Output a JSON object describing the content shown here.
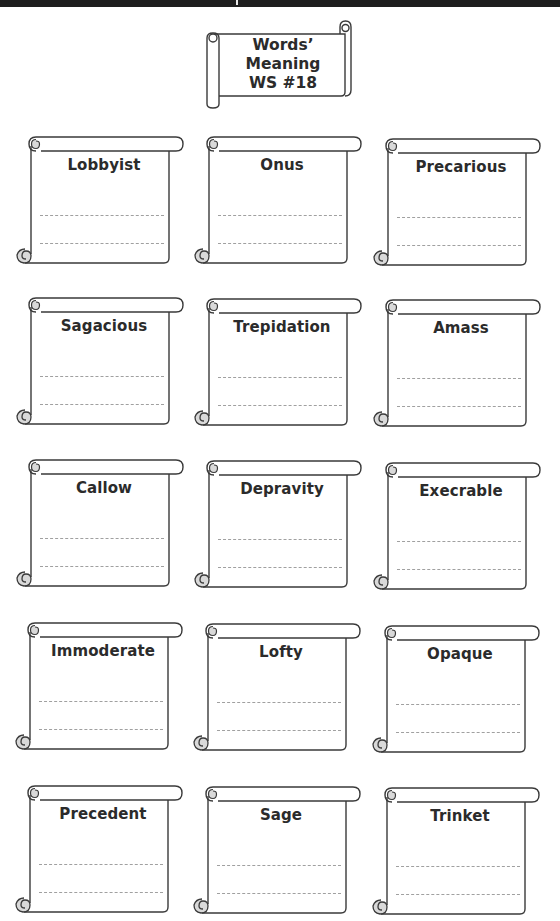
{
  "header": {
    "title_lines": [
      "Words’",
      "Meaning",
      "WS #18"
    ]
  },
  "style": {
    "outline_color": "#3a3a3a",
    "curl_fill": "#d9d9d9",
    "dash_color": "#a0a0a0",
    "text_color": "#2b2b2b"
  },
  "cards": [
    {
      "word": "Lobbyist"
    },
    {
      "word": "Onus"
    },
    {
      "word": "Precarious"
    },
    {
      "word": "Sagacious"
    },
    {
      "word": "Trepidation"
    },
    {
      "word": "Amass"
    },
    {
      "word": "Callow"
    },
    {
      "word": "Depravity"
    },
    {
      "word": "Execrable"
    },
    {
      "word": "Immoderate"
    },
    {
      "word": "Lofty"
    },
    {
      "word": "Opaque"
    },
    {
      "word": "Precedent"
    },
    {
      "word": "Sage"
    },
    {
      "word": "Trinket"
    }
  ],
  "answer_lines_per_card": 2
}
